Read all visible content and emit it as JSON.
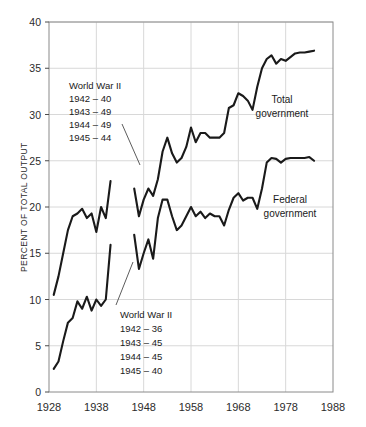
{
  "chart_data": {
    "type": "line",
    "title": "",
    "xlabel": "",
    "ylabel": "PERCENT OF TOTAL OUTPUT",
    "xlim": [
      1928,
      1988
    ],
    "ylim": [
      0,
      40
    ],
    "grid": true,
    "xticks": [
      1928,
      1938,
      1948,
      1958,
      1968,
      1978,
      1988
    ],
    "yticks": [
      0,
      5,
      10,
      15,
      20,
      25,
      30,
      35,
      40
    ],
    "xtick_labels": [
      "1928",
      "1938",
      "1948",
      "1958",
      "1968",
      "1978",
      "1988"
    ],
    "ytick_labels": [
      "0",
      "5",
      "10",
      "15",
      "20",
      "25",
      "30",
      "35",
      "40"
    ],
    "legend_position": "inline-labels",
    "series": [
      {
        "name": "Total government",
        "label": "Total government",
        "color": "#1a1a1a",
        "segments": [
          {
            "name": "prewar",
            "x": [
              1929,
              1930,
              1931,
              1932,
              1933,
              1934,
              1935,
              1936,
              1937,
              1938,
              1939,
              1940,
              1941
            ],
            "y": [
              10.5,
              12.5,
              15.0,
              17.5,
              19.0,
              19.3,
              19.8,
              18.8,
              19.3,
              17.3,
              20.0,
              18.8,
              22.8
            ]
          },
          {
            "name": "postwar",
            "x": [
              1946,
              1947,
              1948,
              1949,
              1950,
              1951,
              1952,
              1953,
              1954,
              1955,
              1956,
              1957,
              1958,
              1959,
              1960,
              1961,
              1962,
              1963,
              1964,
              1965,
              1966,
              1967,
              1968,
              1969,
              1970,
              1971,
              1972,
              1973,
              1974,
              1975,
              1976,
              1977,
              1978,
              1979,
              1980,
              1981,
              1982,
              1983,
              1984
            ],
            "y": [
              22.0,
              19.0,
              20.8,
              22.0,
              21.2,
              23.0,
              26.0,
              27.5,
              25.8,
              24.8,
              25.3,
              26.5,
              28.6,
              27.0,
              28.0,
              28.0,
              27.5,
              27.5,
              27.5,
              28.0,
              30.7,
              31.0,
              32.3,
              32.0,
              31.5,
              30.5,
              33.0,
              35.0,
              36.0,
              36.4,
              35.5,
              36.0,
              35.8,
              36.2,
              36.6,
              36.7,
              36.7,
              36.8,
              36.9
            ]
          }
        ],
        "war_annotation": {
          "title": "World War II",
          "rows": [
            {
              "year": "1942",
              "dash": "–",
              "value": "40"
            },
            {
              "year": "1943",
              "dash": "–",
              "value": "49"
            },
            {
              "year": "1944",
              "dash": "–",
              "value": "49"
            },
            {
              "year": "1945",
              "dash": "–",
              "value": "44"
            }
          ]
        }
      },
      {
        "name": "Federal government",
        "label": "Federal government",
        "color": "#1a1a1a",
        "segments": [
          {
            "name": "prewar",
            "x": [
              1929,
              1930,
              1931,
              1932,
              1933,
              1934,
              1935,
              1936,
              1937,
              1938,
              1939,
              1940,
              1941
            ],
            "y": [
              2.5,
              3.3,
              5.5,
              7.5,
              8.0,
              9.8,
              9.0,
              10.3,
              8.8,
              10.0,
              9.3,
              10.0,
              15.9
            ]
          },
          {
            "name": "postwar",
            "x": [
              1946,
              1947,
              1948,
              1949,
              1950,
              1951,
              1952,
              1953,
              1954,
              1955,
              1956,
              1957,
              1958,
              1959,
              1960,
              1961,
              1962,
              1963,
              1964,
              1965,
              1966,
              1967,
              1968,
              1969,
              1970,
              1971,
              1972,
              1973,
              1974,
              1975,
              1976,
              1977,
              1978,
              1979,
              1980,
              1981,
              1982,
              1983,
              1984
            ],
            "y": [
              17.0,
              13.3,
              15.0,
              16.5,
              14.4,
              18.8,
              20.8,
              20.8,
              19.0,
              17.5,
              18.0,
              19.0,
              20.0,
              19.0,
              19.5,
              18.8,
              19.3,
              19.0,
              19.0,
              18.0,
              19.7,
              21.0,
              21.5,
              20.7,
              21.0,
              21.0,
              19.8,
              22.0,
              24.8,
              25.3,
              25.2,
              24.8,
              25.2,
              25.3,
              25.3,
              25.3,
              25.3,
              25.4,
              25.0
            ]
          }
        ],
        "war_annotation": {
          "title": "World War II",
          "rows": [
            {
              "year": "1942",
              "dash": "–",
              "value": "36"
            },
            {
              "year": "1943",
              "dash": "–",
              "value": "45"
            },
            {
              "year": "1944",
              "dash": "–",
              "value": "45"
            },
            {
              "year": "1945",
              "dash": "–",
              "value": "40"
            }
          ]
        }
      }
    ]
  },
  "annotations": {
    "total": {
      "title": "World War II",
      "line1": "1942 – 40",
      "line2": "1943 – 49",
      "line3": "1944 – 49",
      "line4": "1945 – 44"
    },
    "federal": {
      "title": "World War II",
      "line1": "1942 – 36",
      "line2": "1943 – 45",
      "line3": "1944 – 45",
      "line4": "1945 – 40"
    }
  },
  "labels": {
    "total_line1": "Total",
    "total_line2": "government",
    "federal_line1": "Federal",
    "federal_line2": "government",
    "y_axis_title": "PERCENT OF TOTAL OUTPUT"
  },
  "axis": {
    "y": [
      "40",
      "35",
      "30",
      "25",
      "20",
      "15",
      "10",
      "5",
      "0"
    ],
    "x": [
      "1928",
      "1938",
      "1948",
      "1958",
      "1968",
      "1978",
      "1988"
    ]
  },
  "colors": {
    "series": "#1a1a1a",
    "grid": "#d8d8d8",
    "axis": "#8a8a8a",
    "background": "#ffffff"
  }
}
